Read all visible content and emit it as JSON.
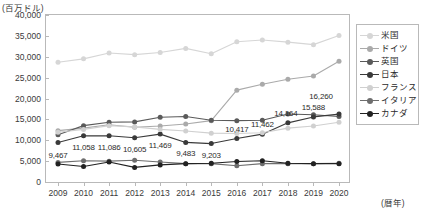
{
  "unit_label": "(百万ドル)",
  "x_axis_unit": "(暦年)",
  "y_ticks": [
    "0",
    "5,000",
    "10,000",
    "15,000",
    "20,000",
    "25,000",
    "30,000",
    "35,000",
    "40,000"
  ],
  "x_ticks": [
    "2009",
    "2010",
    "2011",
    "2012",
    "2013",
    "2014",
    "2015",
    "2016",
    "2017",
    "2018",
    "2019",
    "2020"
  ],
  "legend": {
    "items": [
      {
        "label": "米国",
        "color": "#d6d6d6"
      },
      {
        "label": "ドイツ",
        "color": "#aaaaaa"
      },
      {
        "label": "英国",
        "color": "#5a5a5a"
      },
      {
        "label": "日本",
        "color": "#3a3a3a"
      },
      {
        "label": "フランス",
        "color": "#d0d0d0"
      },
      {
        "label": "イタリア",
        "color": "#6e6e6e"
      },
      {
        "label": "カナダ",
        "color": "#222222"
      }
    ]
  },
  "data_labels": [
    {
      "text": "9,467",
      "x": 2009,
      "y": 9467,
      "dx": 0,
      "dy": 13
    },
    {
      "text": "11,058",
      "x": 2010,
      "y": 11058,
      "dx": 0,
      "dy": 11
    },
    {
      "text": "11,086",
      "x": 2011,
      "y": 11086,
      "dx": 0,
      "dy": 11
    },
    {
      "text": "10,605",
      "x": 2012,
      "y": 10605,
      "dx": 0,
      "dy": 11
    },
    {
      "text": "11,469",
      "x": 2013,
      "y": 11469,
      "dx": 0,
      "dy": 11
    },
    {
      "text": "9,483",
      "x": 2014,
      "y": 9483,
      "dx": 0,
      "dy": 11
    },
    {
      "text": "9,203",
      "x": 2015,
      "y": 9203,
      "dx": 0,
      "dy": 11
    },
    {
      "text": "10,417",
      "x": 2016,
      "y": 10417,
      "dx": 0,
      "dy": -10
    },
    {
      "text": "11,462",
      "x": 2017,
      "y": 11462,
      "dx": 0,
      "dy": -10
    },
    {
      "text": "14,164",
      "x": 2018,
      "y": 14164,
      "dx": -2,
      "dy": -10
    },
    {
      "text": "15,588",
      "x": 2019,
      "y": 15588,
      "dx": 0,
      "dy": -10
    },
    {
      "text": "16,260",
      "x": 2020,
      "y": 16260,
      "dx": -18,
      "dy": -18
    }
  ],
  "chart_data": {
    "type": "line",
    "title": "",
    "xlabel": "(暦年)",
    "ylabel": "(百万ドル)",
    "xlim": [
      2009,
      2020
    ],
    "ylim": [
      0,
      40000
    ],
    "grid": false,
    "legend_position": "right",
    "x": [
      2009,
      2010,
      2011,
      2012,
      2013,
      2014,
      2015,
      2016,
      2017,
      2018,
      2019,
      2020
    ],
    "series": [
      {
        "name": "米国",
        "color": "#d6d6d6",
        "values": [
          28700,
          29500,
          30900,
          30500,
          31000,
          32000,
          30700,
          33600,
          34000,
          33500,
          32900,
          35100
        ]
      },
      {
        "name": "ドイツ",
        "color": "#aaaaaa",
        "values": [
          12300,
          12900,
          13700,
          13100,
          13400,
          13900,
          14700,
          22000,
          23400,
          24600,
          25400,
          28900
        ]
      },
      {
        "name": "英国",
        "color": "#5a5a5a",
        "values": [
          11300,
          13500,
          14300,
          14400,
          15500,
          15700,
          14800,
          14700,
          14800,
          16300,
          16100,
          15700
        ]
      },
      {
        "name": "日本",
        "color": "#3a3a3a",
        "values": [
          9467,
          11058,
          11086,
          10605,
          11469,
          9483,
          9203,
          10417,
          11462,
          14164,
          15588,
          16260
        ]
      },
      {
        "name": "フランス",
        "color": "#d0d0d0",
        "values": [
          11900,
          12600,
          13500,
          13200,
          12600,
          12200,
          11700,
          11600,
          11800,
          12900,
          13400,
          14300
        ]
      },
      {
        "name": "イタリア",
        "color": "#6e6e6e",
        "values": [
          4700,
          5100,
          5000,
          5200,
          4800,
          4400,
          4400,
          3900,
          4400,
          4400,
          4400,
          4500
        ]
      },
      {
        "name": "カナダ",
        "color": "#222222",
        "values": [
          4300,
          3700,
          4800,
          3500,
          4100,
          4400,
          4500,
          4900,
          5100,
          4500,
          4400,
          4400
        ]
      }
    ]
  }
}
